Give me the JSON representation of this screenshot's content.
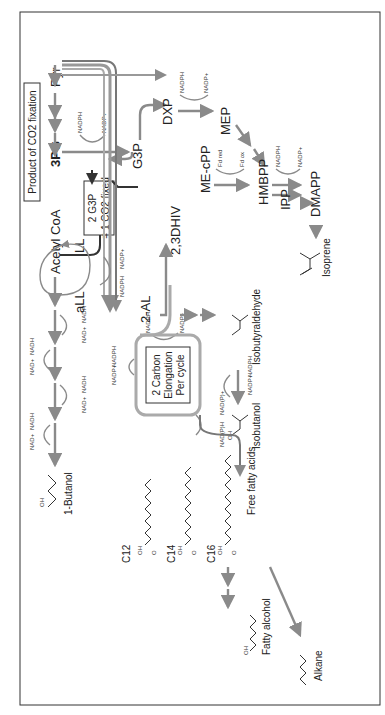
{
  "diagram": {
    "title_box": "Product of CO2 fixation",
    "fixation_box": [
      "2 G3P",
      "= 1 CO2 fixed"
    ],
    "elongation_box": [
      "2 Carbon",
      "Elongation",
      "Per cycle"
    ],
    "metabolites": {
      "3pg": "3PG",
      "g3p": "G3P",
      "pyr": "Pyr",
      "acetyl_coa": "Acetyl CoA",
      "all": "aLL",
      "ll": "LL",
      "dxp": "DXP",
      "mep": "MEP",
      "me_cpp": "ME-cPP",
      "hmbpp": "HMBPP",
      "ipp": "IPP",
      "dmapp": "DMAPP",
      "two_al": "2-AL",
      "dhiv": "2,3DHIV"
    },
    "products": {
      "butanol": "1-Butanol",
      "c12": "C12",
      "c14": "C14",
      "c16": "C16",
      "free_fatty_acids": "Free fatty acids",
      "fatty_alcohol": "Fatty alcohol",
      "alkane": "Alkane",
      "isobutyraldehyde": "Isobutyraldehyde",
      "isobutanol": "Isobutanol",
      "isoprene": "Isoprene"
    },
    "cofactors": {
      "nadph": "NADPH",
      "nadp": "NADP+",
      "nadh": "NADH",
      "nad": "NAD+",
      "nadp_h": "NAD(P)H",
      "nadp_plus": "NAD(P)+",
      "fd_red": "Fd red",
      "fd_ox": "Fd ox"
    },
    "atoms": {
      "oh": "OH",
      "o": "O"
    },
    "colors": {
      "arrow": "#8a8a8a",
      "text": "#222222",
      "dark_arrow": "#333333"
    }
  }
}
